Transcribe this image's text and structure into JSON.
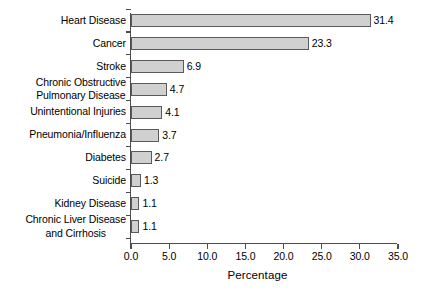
{
  "chart_data": {
    "type": "bar",
    "orientation": "horizontal",
    "title": "",
    "xlabel": "Percentage",
    "ylabel": "",
    "xlim": [
      0.0,
      35.0
    ],
    "xticks": [
      "0.0",
      "5.0",
      "10.0",
      "15.0",
      "20.0",
      "25.0",
      "30.0",
      "35.0"
    ],
    "xtick_values": [
      0,
      5,
      10,
      15,
      20,
      25,
      30,
      35
    ],
    "grid": false,
    "legend": "none",
    "bar_fill_color": "#d0d0d0",
    "bar_edge_color": "#5a5a5a",
    "axis_color": "#4d4d4d",
    "categories": [
      "Heart Disease",
      "Cancer",
      "Stroke",
      "Chronic Obstructive Pulmonary Disease",
      "Unintentional Injuries",
      "Pneumonia/Influenza",
      "Diabetes",
      "Suicide",
      "Kidney Disease",
      "Chronic Liver Disease and Cirrhosis"
    ],
    "category_lines": [
      [
        "Heart Disease"
      ],
      [
        "Cancer"
      ],
      [
        "Stroke"
      ],
      [
        "Chronic Obstructive",
        "Pulmonary Disease"
      ],
      [
        "Unintentional Injuries"
      ],
      [
        "Pneumonia/Influenza"
      ],
      [
        "Diabetes"
      ],
      [
        "Suicide"
      ],
      [
        "Kidney Disease"
      ],
      [
        "Chronic Liver Disease",
        "and Cirrhosis"
      ]
    ],
    "values": [
      31.4,
      23.3,
      6.9,
      4.7,
      4.1,
      3.7,
      2.7,
      1.3,
      1.1,
      1.1
    ],
    "value_labels": [
      "31.4",
      "23.3",
      "6.9",
      "4.7",
      "4.1",
      "3.7",
      "2.7",
      "1.3",
      "1.1",
      "1.1"
    ]
  }
}
